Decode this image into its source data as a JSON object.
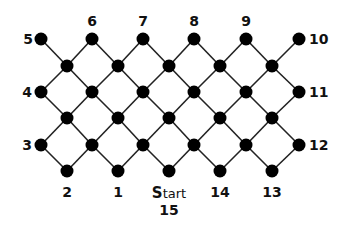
{
  "diagram": {
    "type": "lattice-graph",
    "colors": {
      "node": "#000000",
      "edge": "#222222",
      "label": "#111111",
      "background": "#ffffff"
    },
    "node_radius": 6.5,
    "nodes": [
      {
        "id": "5",
        "x": 41,
        "y": 39,
        "label": "5",
        "lx": 28,
        "ly": 44,
        "anchor": "middle"
      },
      {
        "id": "6",
        "x": 92,
        "y": 39,
        "label": "6",
        "lx": 92,
        "ly": 26,
        "anchor": "middle"
      },
      {
        "id": "7",
        "x": 143,
        "y": 39,
        "label": "7",
        "lx": 143,
        "ly": 26,
        "anchor": "middle"
      },
      {
        "id": "8",
        "x": 194,
        "y": 39,
        "label": "8",
        "lx": 194,
        "ly": 26,
        "anchor": "middle"
      },
      {
        "id": "9",
        "x": 246,
        "y": 39,
        "label": "9",
        "lx": 246,
        "ly": 26,
        "anchor": "middle"
      },
      {
        "id": "10",
        "x": 299,
        "y": 39,
        "label": "10",
        "lx": 309,
        "ly": 44,
        "anchor": "start"
      },
      {
        "id": "a1",
        "x": 67,
        "y": 66,
        "label": ""
      },
      {
        "id": "a2",
        "x": 118,
        "y": 66,
        "label": ""
      },
      {
        "id": "a3",
        "x": 169,
        "y": 66,
        "label": ""
      },
      {
        "id": "a4",
        "x": 220,
        "y": 66,
        "label": ""
      },
      {
        "id": "a5",
        "x": 272,
        "y": 66,
        "label": ""
      },
      {
        "id": "4",
        "x": 41,
        "y": 92,
        "label": "4",
        "lx": 27,
        "ly": 97,
        "anchor": "middle"
      },
      {
        "id": "b1",
        "x": 92,
        "y": 92,
        "label": ""
      },
      {
        "id": "b2",
        "x": 143,
        "y": 92,
        "label": ""
      },
      {
        "id": "b3",
        "x": 194,
        "y": 92,
        "label": ""
      },
      {
        "id": "b4",
        "x": 246,
        "y": 92,
        "label": ""
      },
      {
        "id": "11",
        "x": 299,
        "y": 92,
        "label": "11",
        "lx": 309,
        "ly": 97,
        "anchor": "start"
      },
      {
        "id": "c1",
        "x": 67,
        "y": 118,
        "label": ""
      },
      {
        "id": "c2",
        "x": 118,
        "y": 118,
        "label": ""
      },
      {
        "id": "c3",
        "x": 169,
        "y": 118,
        "label": ""
      },
      {
        "id": "c4",
        "x": 220,
        "y": 118,
        "label": ""
      },
      {
        "id": "c5",
        "x": 272,
        "y": 118,
        "label": ""
      },
      {
        "id": "3",
        "x": 41,
        "y": 145,
        "label": "3",
        "lx": 27,
        "ly": 150,
        "anchor": "middle"
      },
      {
        "id": "d1",
        "x": 92,
        "y": 145,
        "label": ""
      },
      {
        "id": "d2",
        "x": 143,
        "y": 145,
        "label": ""
      },
      {
        "id": "d3",
        "x": 194,
        "y": 145,
        "label": ""
      },
      {
        "id": "d4",
        "x": 246,
        "y": 145,
        "label": ""
      },
      {
        "id": "12",
        "x": 299,
        "y": 145,
        "label": "12",
        "lx": 309,
        "ly": 150,
        "anchor": "start"
      },
      {
        "id": "2",
        "x": 67,
        "y": 171,
        "label": "2",
        "lx": 67,
        "ly": 197,
        "anchor": "middle"
      },
      {
        "id": "1",
        "x": 118,
        "y": 171,
        "label": "1",
        "lx": 118,
        "ly": 197,
        "anchor": "middle"
      },
      {
        "id": "15",
        "x": 169,
        "y": 171,
        "label": "15",
        "lx": 169,
        "ly": 215,
        "anchor": "middle"
      },
      {
        "id": "14",
        "x": 220,
        "y": 171,
        "label": "14",
        "lx": 220,
        "ly": 197,
        "anchor": "middle"
      },
      {
        "id": "13",
        "x": 272,
        "y": 171,
        "label": "13",
        "lx": 272,
        "ly": 197,
        "anchor": "middle"
      }
    ],
    "start_label": {
      "text_bold": "S",
      "text_rest": "tart",
      "x": 169,
      "y": 198
    },
    "edges": [
      [
        "5",
        "a1"
      ],
      [
        "6",
        "a1"
      ],
      [
        "6",
        "a2"
      ],
      [
        "7",
        "a2"
      ],
      [
        "7",
        "a3"
      ],
      [
        "8",
        "a3"
      ],
      [
        "8",
        "a4"
      ],
      [
        "9",
        "a4"
      ],
      [
        "9",
        "a5"
      ],
      [
        "10",
        "a5"
      ],
      [
        "a1",
        "4"
      ],
      [
        "a1",
        "b1"
      ],
      [
        "a2",
        "b1"
      ],
      [
        "a2",
        "b2"
      ],
      [
        "a3",
        "b2"
      ],
      [
        "a3",
        "b3"
      ],
      [
        "a4",
        "b3"
      ],
      [
        "a4",
        "b4"
      ],
      [
        "a5",
        "b4"
      ],
      [
        "a5",
        "11"
      ],
      [
        "4",
        "c1"
      ],
      [
        "b1",
        "c1"
      ],
      [
        "b1",
        "c2"
      ],
      [
        "b2",
        "c2"
      ],
      [
        "b2",
        "c3"
      ],
      [
        "b3",
        "c3"
      ],
      [
        "b3",
        "c4"
      ],
      [
        "b4",
        "c4"
      ],
      [
        "b4",
        "c5"
      ],
      [
        "11",
        "c5"
      ],
      [
        "c1",
        "3"
      ],
      [
        "c1",
        "d1"
      ],
      [
        "c2",
        "d1"
      ],
      [
        "c2",
        "d2"
      ],
      [
        "c3",
        "d2"
      ],
      [
        "c3",
        "d3"
      ],
      [
        "c4",
        "d3"
      ],
      [
        "c4",
        "d4"
      ],
      [
        "c5",
        "d4"
      ],
      [
        "c5",
        "12"
      ],
      [
        "3",
        "2"
      ],
      [
        "d1",
        "2"
      ],
      [
        "d1",
        "1"
      ],
      [
        "d2",
        "1"
      ],
      [
        "d2",
        "15"
      ],
      [
        "d3",
        "15"
      ],
      [
        "d3",
        "14"
      ],
      [
        "d4",
        "14"
      ],
      [
        "d4",
        "13"
      ],
      [
        "12",
        "13"
      ]
    ]
  }
}
